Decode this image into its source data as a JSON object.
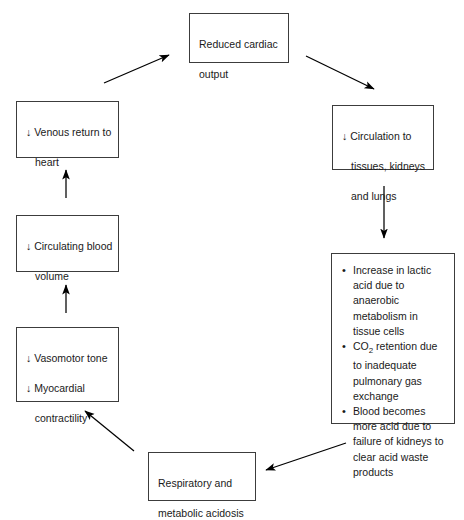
{
  "diagram": {
    "type": "flow-cycle",
    "colors": {
      "box_border": "#3c3c3c",
      "text": "#1a1a1a",
      "arrow": "#000000",
      "background": "#ffffff"
    },
    "down_arrow_glyph": "↓",
    "bullet_glyph": "•",
    "nodes": [
      {
        "id": "reduced-cardiac-output",
        "lines": [
          "Reduced cardiac",
          "output"
        ]
      },
      {
        "id": "circulation-to-tissues",
        "lines": [
          "↓ Circulation to",
          "tissues, kidneys",
          "and lungs"
        ]
      },
      {
        "id": "acid-base-effects",
        "bullets": [
          "Increase in lactic acid due to anaerobic metabolism in tissue cells",
          "CO2 retention due to inadequate pulmonary gas exchange",
          "Blood becomes more acid due to failure of kidneys to clear acid waste products"
        ],
        "bullet_parts": {
          "b2_pre": "CO",
          "b2_sub": "2",
          "b2_post": " retention due to inadequate pulmonary gas exchange"
        }
      },
      {
        "id": "respiratory-metabolic-acidosis",
        "lines": [
          "Respiratory and",
          "metabolic acidosis"
        ]
      },
      {
        "id": "vasomotor-tone-myocardial-contractility",
        "lines": [
          "↓ Vasomotor tone",
          "↓ Myocardial",
          "   contractility"
        ]
      },
      {
        "id": "circulating-blood-volume",
        "lines": [
          "↓ Circulating blood",
          "volume"
        ]
      },
      {
        "id": "venous-return-to-heart",
        "lines": [
          "↓ Venous return to",
          "heart"
        ]
      }
    ],
    "edges": [
      {
        "from": "venous-return-to-heart",
        "to": "reduced-cardiac-output",
        "direction": "up-right"
      },
      {
        "from": "reduced-cardiac-output",
        "to": "circulation-to-tissues",
        "direction": "down-right"
      },
      {
        "from": "circulation-to-tissues",
        "to": "acid-base-effects",
        "direction": "down"
      },
      {
        "from": "acid-base-effects",
        "to": "respiratory-metabolic-acidosis",
        "direction": "down-left"
      },
      {
        "from": "respiratory-metabolic-acidosis",
        "to": "vasomotor-tone-myocardial-contractility",
        "direction": "up-left"
      },
      {
        "from": "vasomotor-tone-myocardial-contractility",
        "to": "circulating-blood-volume",
        "direction": "up"
      },
      {
        "from": "circulating-blood-volume",
        "to": "venous-return-to-heart",
        "direction": "up"
      }
    ]
  }
}
